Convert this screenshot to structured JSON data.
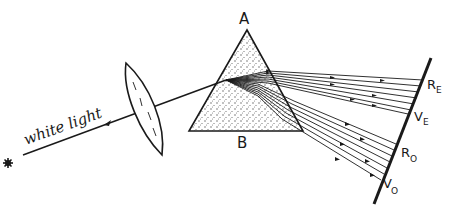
{
  "diagram": {
    "type": "optics-double-refraction",
    "labels": {
      "source_text": "white light",
      "apex": "A",
      "base": "B",
      "red_extraordinary": {
        "main": "R",
        "sub": "E"
      },
      "violet_extraordinary": {
        "main": "V",
        "sub": "E"
      },
      "red_ordinary": {
        "main": "R",
        "sub": "O"
      },
      "violet_ordinary": {
        "main": "V",
        "sub": "O"
      }
    },
    "elements": [
      "light-source",
      "converging-lens",
      "birefringent-prism",
      "screen"
    ],
    "colors": {
      "ink": "#1a1a1a",
      "background": "#ffffff",
      "stipple": "#555555"
    }
  }
}
